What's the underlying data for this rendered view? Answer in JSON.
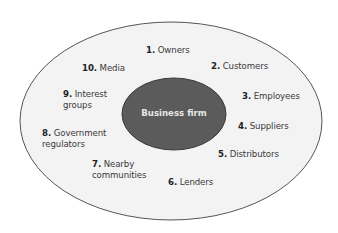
{
  "diagram": {
    "center": {
      "label": "Business firm"
    },
    "stakeholders": [
      {
        "number": "1.",
        "lines": [
          "Owners"
        ]
      },
      {
        "number": "2.",
        "lines": [
          "Customers"
        ]
      },
      {
        "number": "3.",
        "lines": [
          "Employees"
        ]
      },
      {
        "number": "4.",
        "lines": [
          "Suppliers"
        ]
      },
      {
        "number": "5.",
        "lines": [
          "Distributors"
        ]
      },
      {
        "number": "6.",
        "lines": [
          "Lenders"
        ]
      },
      {
        "number": "7.",
        "lines": [
          "Nearby",
          "communities"
        ]
      },
      {
        "number": "8.",
        "lines": [
          "Government",
          "regulators"
        ]
      },
      {
        "number": "9.",
        "lines": [
          "Interest",
          "groups"
        ]
      },
      {
        "number": "10.",
        "lines": [
          "Media"
        ]
      }
    ],
    "colors": {
      "outer_fill": "#f3f3f3",
      "outer_stroke": "#555555",
      "inner_fill": "#5b5b5b",
      "inner_stroke": "#3a3a3a",
      "center_text": "#e6e6e6"
    }
  }
}
